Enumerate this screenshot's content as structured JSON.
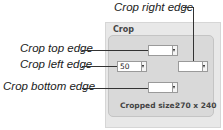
{
  "callouts": {
    "right": "Crop right edge",
    "top": "Crop top edge",
    "left": "Crop left edge",
    "bottom": "Crop bottom edge"
  },
  "panel": {
    "title": "Crop",
    "fields": {
      "top": "",
      "left": "50",
      "right": "",
      "bottom": ""
    },
    "cropped_size_label": "Cropped size:",
    "cropped_size_value": "270 x 240"
  }
}
